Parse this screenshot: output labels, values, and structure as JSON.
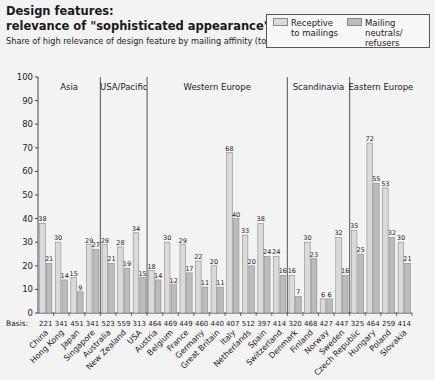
{
  "header": {
    "title_line1": "Design features:",
    "title_line2": "relevance of \"sophisticated appearance\" in %",
    "subtitle": "Share of high relevance of design feature by mailing affinity (top 2 boxes)"
  },
  "legend": {
    "receptive_line1": "Receptive",
    "receptive_line2": "to mailings",
    "neutral_line1": "Mailing neutrals/",
    "neutral_line2": "refusers"
  },
  "colors": {
    "background": "#f3f3f3",
    "receptive": "#dadada",
    "neutral": "#bcbcbc",
    "outline": "#8a8a8a",
    "axis": "#444444",
    "divider": "#555555"
  },
  "axis": {
    "basis_label": "Basis:"
  },
  "chart_data": {
    "type": "bar",
    "title": "Design features: relevance of \"sophisticated appearance\" in %",
    "subtitle": "Share of high relevance of design feature by mailing affinity (top 2 boxes)",
    "xlabel": "",
    "ylabel": "",
    "ylim": [
      0,
      100
    ],
    "yticks": [
      0,
      10,
      20,
      30,
      40,
      50,
      60,
      70,
      80,
      90,
      100
    ],
    "grid": false,
    "legend_position": "top-right",
    "categories": [
      "China",
      "Hong Kong",
      "Japan",
      "Singapore",
      "Australia",
      "New Zealand",
      "USA",
      "Austria",
      "Belgium",
      "France",
      "Germany",
      "Great Britain",
      "Italy",
      "Netherlands",
      "Spain",
      "Switzerland",
      "Denmark",
      "Finland",
      "Norway",
      "Sweden",
      "Czech Republic",
      "Hungary",
      "Poland",
      "Slovakia"
    ],
    "basis": [
      221,
      341,
      451,
      341,
      523,
      559,
      313,
      464,
      469,
      449,
      460,
      440,
      407,
      512,
      397,
      414,
      320,
      468,
      427,
      447,
      325,
      464,
      259,
      414
    ],
    "series": [
      {
        "name": "Receptive to mailings",
        "values": [
          38,
          30,
          15,
          29,
          29,
          28,
          34,
          18,
          30,
          29,
          22,
          20,
          68,
          33,
          38,
          24,
          16,
          30,
          6,
          32,
          35,
          72,
          53,
          30
        ]
      },
      {
        "name": "Mailing neutrals/ refusers",
        "values": [
          21,
          14,
          9,
          27,
          21,
          19,
          15,
          14,
          12,
          17,
          11,
          11,
          40,
          20,
          24,
          16,
          7,
          23,
          6,
          16,
          25,
          55,
          32,
          21
        ]
      }
    ],
    "regions": [
      {
        "name": "Asia",
        "start": 0,
        "end": 3
      },
      {
        "name": "USA/Pacific",
        "start": 4,
        "end": 6
      },
      {
        "name": "Western Europe",
        "start": 7,
        "end": 15
      },
      {
        "name": "Scandinavia",
        "start": 16,
        "end": 19
      },
      {
        "name": "Eastern Europe",
        "start": 20,
        "end": 23
      }
    ]
  }
}
